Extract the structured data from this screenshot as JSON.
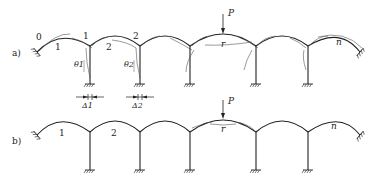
{
  "figure": {
    "panels": [
      {
        "id": "a",
        "label": "a)",
        "arch_labels": [
          "0",
          "1",
          "1",
          "2",
          "2",
          "r",
          "n"
        ],
        "angle_labels": [
          "θ1",
          "θ2"
        ],
        "displacement_labels": [
          "Δ1",
          "Δ2"
        ],
        "load_label": "P"
      },
      {
        "id": "b",
        "label": "b)",
        "arch_labels": [
          "1",
          "2",
          "r",
          "n"
        ],
        "load_label": "P"
      }
    ],
    "colors": {
      "line": "#222222",
      "deformed": "#555555"
    }
  }
}
